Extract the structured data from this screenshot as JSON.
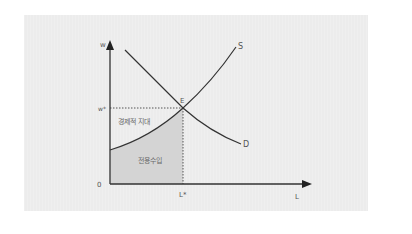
{
  "diagram": {
    "title": "",
    "axes": {
      "y_label": "w",
      "x_label": "L",
      "origin_label": "0"
    },
    "equilibrium": {
      "point_label": "E",
      "wage_label": "w*",
      "quantity_label": "L*"
    },
    "curves": {
      "supply_label": "S",
      "demand_label": "D"
    },
    "regions": {
      "economic_rent_label": "경제적 지대",
      "transfer_earnings_label": "전용수입"
    },
    "colors": {
      "panel_bg": "#ececec",
      "shaded_region": "#d4d4d4",
      "curve": "#333333",
      "label": "#555555"
    }
  }
}
